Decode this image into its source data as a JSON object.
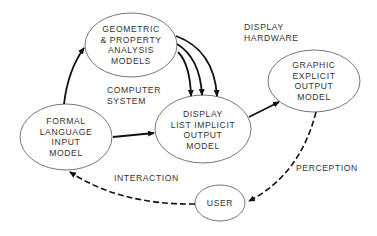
{
  "diagram": {
    "nodes": [
      {
        "id": "geometric",
        "lines": [
          "GEOMETRIC",
          "& PROPERTY",
          "ANALYSIS",
          "MODELS"
        ]
      },
      {
        "id": "formal",
        "lines": [
          "FORMAL",
          "LANGUAGE",
          "INPUT",
          "MODEL"
        ]
      },
      {
        "id": "display_list",
        "lines": [
          "DISPLAY",
          "LIST IMPLICIT",
          "OUTPUT",
          "MODEL"
        ]
      },
      {
        "id": "graphic",
        "lines": [
          "GRAPHIC",
          "EXPLICIT",
          "OUTPUT",
          "MODEL"
        ]
      },
      {
        "id": "user",
        "lines": [
          "USER"
        ]
      }
    ],
    "labels": {
      "computer_system": [
        "COMPUTER",
        "SYSTEM"
      ],
      "display_hardware": [
        "DISPLAY",
        "HARDWARE"
      ],
      "interaction": "INTERACTION",
      "perception": "PERCEPTION"
    },
    "edges": [
      {
        "from": "formal",
        "to": "geometric",
        "style": "solid"
      },
      {
        "from": "geometric",
        "to": "display_list",
        "style": "solid",
        "count": 3
      },
      {
        "from": "formal",
        "to": "display_list",
        "style": "solid"
      },
      {
        "from": "display_list",
        "to": "graphic",
        "style": "solid"
      },
      {
        "from": "graphic",
        "to": "user",
        "style": "dashed",
        "label": "PERCEPTION"
      },
      {
        "from": "user",
        "to": "formal",
        "style": "dashed",
        "label": "INTERACTION"
      }
    ],
    "colors": {
      "line": "#111111",
      "ellipse": "#777777",
      "text": "#333333"
    }
  }
}
